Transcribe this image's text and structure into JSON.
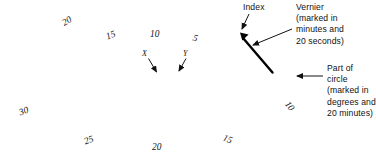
{
  "diagram": {
    "colors": {
      "ink": "#111111",
      "line": "#3a3a3a",
      "index": "#000000"
    }
  },
  "annotations": {
    "index": {
      "label": "Index"
    },
    "vernier": {
      "line1": "Vernier",
      "line2": "(marked in",
      "line3": "minutes and",
      "line4": "20 seconds)"
    },
    "circle": {
      "line1": "Part of",
      "line2": "circle",
      "line3": "(marked in",
      "line4": "degrees and",
      "line5": "20 minutes)"
    }
  },
  "markers": [
    {
      "id": "x",
      "label": "X"
    },
    {
      "id": "y",
      "label": "Y"
    }
  ],
  "scale_labels": {
    "upper": [
      {
        "id": "u-20",
        "text": "20"
      },
      {
        "id": "u-15",
        "text": "15"
      },
      {
        "id": "u-10",
        "text": "10"
      },
      {
        "id": "u-5",
        "text": "5"
      }
    ],
    "lower": [
      {
        "id": "l-30",
        "text": "30"
      },
      {
        "id": "l-25",
        "text": "25"
      },
      {
        "id": "l-20",
        "text": "20"
      },
      {
        "id": "l-15",
        "text": "15"
      },
      {
        "id": "l-10",
        "text": "10"
      }
    ]
  },
  "chart_data": {
    "type": "diagram",
    "arc": {
      "center_x": 188,
      "center_y": -205,
      "radius": 300,
      "start_angle_deg": -41,
      "end_angle_deg": 41
    },
    "major_graduation_labels": [
      "30",
      "25",
      "20",
      "15",
      "10",
      "5",
      "10",
      "15",
      "20"
    ],
    "vernier_note": "marked in minutes and 20 seconds",
    "circle_note": "marked in degrees and 20 minutes"
  }
}
